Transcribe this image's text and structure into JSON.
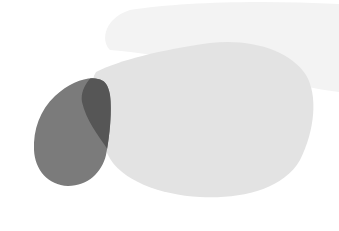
{
  "scene": {
    "width": 339,
    "height": 231,
    "background": "#ffffff",
    "shapes": [
      {
        "name": "faint-top-blob",
        "color": "#f3f3f3"
      },
      {
        "name": "light-gray-blob",
        "color": "#e3e3e3"
      },
      {
        "name": "dark-gray-teardrop",
        "color": "#7b7b7b"
      },
      {
        "name": "overlap-region",
        "color": "#565656"
      }
    ]
  }
}
